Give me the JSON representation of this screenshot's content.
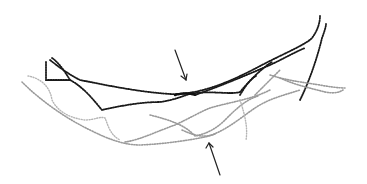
{
  "figure": {
    "colors": {
      "background": "#ffffff",
      "dark_strands": "#1a1a1a",
      "grey_strands": "#9a9a9a",
      "arrows": "#222222"
    },
    "annotations": [
      {
        "type": "arrow",
        "direction": "down-right",
        "target": "dark strand crossover (upper center)"
      },
      {
        "type": "arrow",
        "direction": "up-left",
        "target": "grey strand crossover (lower center)"
      }
    ]
  }
}
